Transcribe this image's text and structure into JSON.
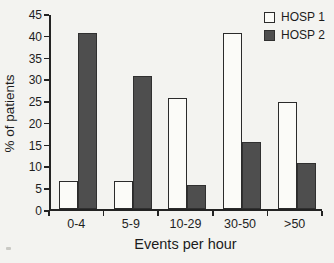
{
  "chart_data": {
    "type": "bar",
    "title": "",
    "xlabel": "Events per hour",
    "ylabel": "% of patients",
    "categories": [
      "0-4",
      "5-9",
      "10-29",
      "30-50",
      ">50"
    ],
    "series": [
      {
        "name": "HOSP 1",
        "values": [
          6.5,
          6.5,
          25.5,
          40.5,
          24.5
        ],
        "fill": "#fbfbf8",
        "border": "#2b2b2b"
      },
      {
        "name": "HOSP 2",
        "values": [
          40.5,
          30.5,
          5.5,
          15.5,
          10.5
        ],
        "fill": "#4e4e4e",
        "border": "#303030"
      }
    ],
    "ylim": [
      0,
      45
    ],
    "yticks": [
      0,
      5,
      10,
      15,
      20,
      25,
      30,
      35,
      40,
      45
    ],
    "grid": false,
    "legend_position": "top-right",
    "axis_color": "#232323"
  }
}
